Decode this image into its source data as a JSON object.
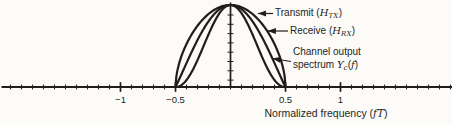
{
  "figure": {
    "ink_color": "#201d1a",
    "background_color": "#fcfbf8"
  },
  "chart_data": {
    "type": "line",
    "title": "",
    "xlabel_prefix": "Normalized frequency (",
    "xlabel_math": "fT",
    "xlabel_suffix": ")",
    "ylabel": "",
    "xlim": [
      -2.0,
      2.0
    ],
    "ylim": [
      0,
      1
    ],
    "grid": false,
    "minor_tick_step": 0.1,
    "x_major_ticks": [
      -1,
      -0.5,
      0.5,
      1
    ],
    "x_tick_labels": [
      "−1",
      "−0.5",
      "0.5",
      "1"
    ],
    "y_axis_minor_tick_count": 8,
    "x_samples": [
      -0.5,
      -0.4,
      -0.3,
      -0.2,
      -0.1,
      0,
      0.1,
      0.2,
      0.3,
      0.4,
      0.5
    ],
    "series": [
      {
        "name": "Transmit (H_TX)",
        "curve": "cos(pi*f)^a on support, zero elsewhere",
        "exponent": 0.55,
        "support": [
          -0.5,
          0.5
        ],
        "peak": 1.0,
        "values": [
          0,
          0.524,
          0.747,
          0.89,
          0.973,
          1.0,
          0.973,
          0.89,
          0.747,
          0.524,
          0
        ]
      },
      {
        "name": "Receive (H_RX)",
        "curve": "cos(pi*f)^a on support, zero elsewhere",
        "exponent": 1.05,
        "support": [
          -0.5,
          0.5
        ],
        "peak": 1.0,
        "values": [
          0,
          0.292,
          0.573,
          0.8,
          0.948,
          1.0,
          0.948,
          0.8,
          0.573,
          0.292,
          0
        ]
      },
      {
        "name": "Channel output spectrum Y_c(f)",
        "curve": "cos(pi*f)^a on support, zero elsewhere",
        "exponent": 2.1,
        "support": [
          -0.5,
          0.5
        ],
        "peak": 1.0,
        "values": [
          0,
          0.085,
          0.328,
          0.641,
          0.9,
          1.0,
          0.9,
          0.641,
          0.328,
          0.085,
          0
        ]
      }
    ]
  },
  "annotations": {
    "transmit": {
      "prefix": "Transmit (",
      "symbol": "H",
      "subscript": "TX",
      "suffix": ")",
      "arrow": {
        "x1": 273,
        "y1": 13.5,
        "x2": 258,
        "y2": 13.5
      }
    },
    "receive": {
      "prefix": "Receive (",
      "symbol": "H",
      "subscript": "RX",
      "suffix": ")",
      "arrow": {
        "x1": 288,
        "y1": 31,
        "x2": 267.5,
        "y2": 31
      }
    },
    "channel": {
      "line1": "Channel output",
      "line2_prefix": "spectrum ",
      "symbol": "Y",
      "subscript": "c",
      "open_paren": "(",
      "fvar": "f",
      "close_paren": ")",
      "arrow": {
        "x1": 291,
        "y1": 61.5,
        "x2": 272.5,
        "y2": 58.5
      }
    }
  }
}
